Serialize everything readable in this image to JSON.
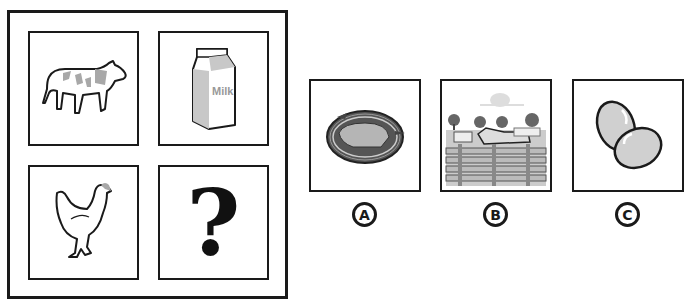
{
  "puzzle": {
    "grid": [
      {
        "id": "cow",
        "icon": "cow-icon",
        "description": "Cow"
      },
      {
        "id": "milk",
        "icon": "milk-carton-icon",
        "description": "Milk carton",
        "text": "Milk"
      },
      {
        "id": "hen",
        "icon": "hen-icon",
        "description": "Hen"
      },
      {
        "id": "unknown",
        "icon": "question-mark-icon",
        "text": "?"
      }
    ],
    "options": [
      {
        "label": "A",
        "icon": "nest-icon",
        "description": "Bird nest"
      },
      {
        "label": "B",
        "icon": "farm-field-icon",
        "description": "Cows in fenced farm field"
      },
      {
        "label": "C",
        "icon": "eggs-icon",
        "description": "Two eggs"
      }
    ]
  },
  "colors": {
    "stroke": "#1a1a1a",
    "gray_fill": "#b8b8b8",
    "background": "#ffffff"
  }
}
